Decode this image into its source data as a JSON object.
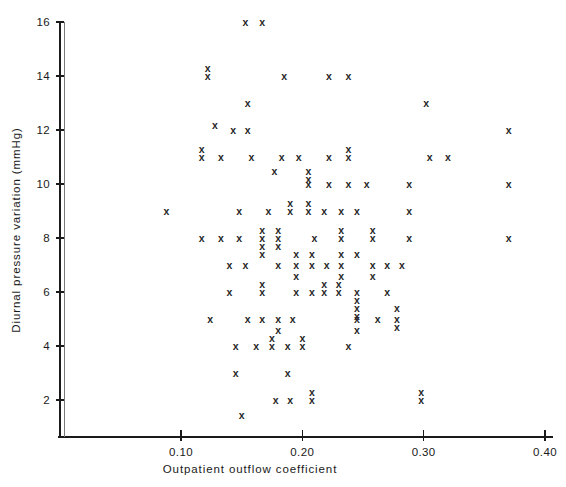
{
  "chart_data": {
    "type": "scatter",
    "title": "",
    "xlabel": "Outpatient outflow coefficient",
    "ylabel": "Diurnal pressure variation (mmHg)",
    "marker": "x",
    "grid": false,
    "legend": null,
    "xlim": [
      0.0,
      0.4083
    ],
    "ylim": [
      1.3,
      16.3
    ],
    "xticks": [
      0.1,
      0.2,
      0.3,
      0.4
    ],
    "xtick_labels": [
      "0.10",
      "0.20",
      "0.30",
      "0.40"
    ],
    "yticks": [
      2,
      4,
      6,
      8,
      10,
      12,
      14,
      16
    ],
    "ytick_labels": [
      "2",
      "4",
      "6",
      "8",
      "10",
      "12",
      "14",
      "16"
    ],
    "points": [
      {
        "x": 0.153,
        "y": 16
      },
      {
        "x": 0.167,
        "y": 16
      },
      {
        "x": 0.122,
        "y": 14.3
      },
      {
        "x": 0.122,
        "y": 14
      },
      {
        "x": 0.185,
        "y": 14
      },
      {
        "x": 0.222,
        "y": 14
      },
      {
        "x": 0.238,
        "y": 14
      },
      {
        "x": 0.155,
        "y": 13
      },
      {
        "x": 0.302,
        "y": 13
      },
      {
        "x": 0.143,
        "y": 12
      },
      {
        "x": 0.155,
        "y": 12
      },
      {
        "x": 0.128,
        "y": 12.2
      },
      {
        "x": 0.37,
        "y": 12
      },
      {
        "x": 0.117,
        "y": 11.3
      },
      {
        "x": 0.117,
        "y": 11
      },
      {
        "x": 0.133,
        "y": 11
      },
      {
        "x": 0.158,
        "y": 11
      },
      {
        "x": 0.183,
        "y": 11
      },
      {
        "x": 0.197,
        "y": 11
      },
      {
        "x": 0.222,
        "y": 11
      },
      {
        "x": 0.238,
        "y": 11.3
      },
      {
        "x": 0.238,
        "y": 11
      },
      {
        "x": 0.305,
        "y": 11
      },
      {
        "x": 0.32,
        "y": 11
      },
      {
        "x": 0.177,
        "y": 10.5
      },
      {
        "x": 0.205,
        "y": 10.5
      },
      {
        "x": 0.205,
        "y": 10.2
      },
      {
        "x": 0.205,
        "y": 10
      },
      {
        "x": 0.222,
        "y": 10
      },
      {
        "x": 0.238,
        "y": 10
      },
      {
        "x": 0.253,
        "y": 10
      },
      {
        "x": 0.288,
        "y": 10
      },
      {
        "x": 0.37,
        "y": 10
      },
      {
        "x": 0.088,
        "y": 9
      },
      {
        "x": 0.148,
        "y": 9
      },
      {
        "x": 0.172,
        "y": 9
      },
      {
        "x": 0.19,
        "y": 9.3
      },
      {
        "x": 0.19,
        "y": 9
      },
      {
        "x": 0.205,
        "y": 9.3
      },
      {
        "x": 0.205,
        "y": 9
      },
      {
        "x": 0.218,
        "y": 9
      },
      {
        "x": 0.232,
        "y": 9
      },
      {
        "x": 0.245,
        "y": 9
      },
      {
        "x": 0.288,
        "y": 9
      },
      {
        "x": 0.117,
        "y": 8
      },
      {
        "x": 0.133,
        "y": 8
      },
      {
        "x": 0.148,
        "y": 8
      },
      {
        "x": 0.167,
        "y": 8.3
      },
      {
        "x": 0.167,
        "y": 8
      },
      {
        "x": 0.167,
        "y": 7.7
      },
      {
        "x": 0.18,
        "y": 8.3
      },
      {
        "x": 0.18,
        "y": 8
      },
      {
        "x": 0.18,
        "y": 7.7
      },
      {
        "x": 0.21,
        "y": 8
      },
      {
        "x": 0.232,
        "y": 8.3
      },
      {
        "x": 0.232,
        "y": 8
      },
      {
        "x": 0.258,
        "y": 8.3
      },
      {
        "x": 0.258,
        "y": 8
      },
      {
        "x": 0.288,
        "y": 8
      },
      {
        "x": 0.37,
        "y": 8
      },
      {
        "x": 0.167,
        "y": 7.4
      },
      {
        "x": 0.195,
        "y": 7.4
      },
      {
        "x": 0.208,
        "y": 7.4
      },
      {
        "x": 0.232,
        "y": 7.4
      },
      {
        "x": 0.245,
        "y": 7.4
      },
      {
        "x": 0.14,
        "y": 7
      },
      {
        "x": 0.153,
        "y": 7
      },
      {
        "x": 0.18,
        "y": 7
      },
      {
        "x": 0.195,
        "y": 7
      },
      {
        "x": 0.208,
        "y": 7
      },
      {
        "x": 0.22,
        "y": 7
      },
      {
        "x": 0.232,
        "y": 7
      },
      {
        "x": 0.258,
        "y": 7
      },
      {
        "x": 0.27,
        "y": 7
      },
      {
        "x": 0.282,
        "y": 7
      },
      {
        "x": 0.195,
        "y": 6.6
      },
      {
        "x": 0.232,
        "y": 6.6
      },
      {
        "x": 0.258,
        "y": 6.6
      },
      {
        "x": 0.14,
        "y": 6
      },
      {
        "x": 0.167,
        "y": 6.3
      },
      {
        "x": 0.167,
        "y": 6
      },
      {
        "x": 0.195,
        "y": 6
      },
      {
        "x": 0.208,
        "y": 6
      },
      {
        "x": 0.218,
        "y": 6.3
      },
      {
        "x": 0.218,
        "y": 6
      },
      {
        "x": 0.23,
        "y": 6.3
      },
      {
        "x": 0.23,
        "y": 6
      },
      {
        "x": 0.245,
        "y": 6
      },
      {
        "x": 0.245,
        "y": 5.7
      },
      {
        "x": 0.27,
        "y": 6
      },
      {
        "x": 0.245,
        "y": 5.4
      },
      {
        "x": 0.245,
        "y": 5.1
      },
      {
        "x": 0.278,
        "y": 5.4
      },
      {
        "x": 0.124,
        "y": 5
      },
      {
        "x": 0.155,
        "y": 5
      },
      {
        "x": 0.167,
        "y": 5
      },
      {
        "x": 0.18,
        "y": 5
      },
      {
        "x": 0.192,
        "y": 5
      },
      {
        "x": 0.245,
        "y": 5
      },
      {
        "x": 0.262,
        "y": 5
      },
      {
        "x": 0.278,
        "y": 5
      },
      {
        "x": 0.278,
        "y": 4.7
      },
      {
        "x": 0.18,
        "y": 4.6
      },
      {
        "x": 0.245,
        "y": 4.6
      },
      {
        "x": 0.145,
        "y": 4
      },
      {
        "x": 0.162,
        "y": 4
      },
      {
        "x": 0.175,
        "y": 4.3
      },
      {
        "x": 0.175,
        "y": 4
      },
      {
        "x": 0.188,
        "y": 4
      },
      {
        "x": 0.2,
        "y": 4.3
      },
      {
        "x": 0.2,
        "y": 4
      },
      {
        "x": 0.238,
        "y": 4
      },
      {
        "x": 0.145,
        "y": 3
      },
      {
        "x": 0.188,
        "y": 3
      },
      {
        "x": 0.178,
        "y": 2
      },
      {
        "x": 0.19,
        "y": 2
      },
      {
        "x": 0.208,
        "y": 2.3
      },
      {
        "x": 0.208,
        "y": 2
      },
      {
        "x": 0.298,
        "y": 2.3
      },
      {
        "x": 0.298,
        "y": 2
      },
      {
        "x": 0.15,
        "y": 1.45
      }
    ]
  }
}
